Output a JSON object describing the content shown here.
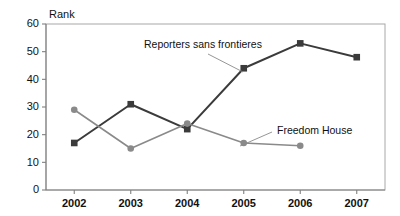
{
  "chart_data": {
    "type": "line",
    "title": "",
    "xlabel": "",
    "ylabel": "Rank",
    "categories": [
      "2002",
      "2003",
      "2004",
      "2005",
      "2006",
      "2007"
    ],
    "x": [
      2002,
      2003,
      2004,
      2005,
      2006,
      2007
    ],
    "ylim": [
      0,
      60
    ],
    "yticks": [
      0,
      10,
      20,
      30,
      40,
      50,
      60
    ],
    "grid": false,
    "legend_position": "inline-annotation",
    "series": [
      {
        "name": "Reporters sans frontieres",
        "marker": "square",
        "color": "#3b3b3b",
        "values": [
          17,
          31,
          22,
          44,
          53,
          48
        ]
      },
      {
        "name": "Freedom House",
        "marker": "circle",
        "color": "#8a8a8a",
        "values": [
          29,
          15,
          24,
          17,
          16,
          null
        ]
      }
    ],
    "annotations": [
      {
        "text": "Reporters sans frontieres",
        "text_x": 144,
        "text_y": 48,
        "leader_from_x": 208,
        "leader_from_y": 54,
        "leader_to_x": 243,
        "leader_to_y": 72
      },
      {
        "text": "Freedom House",
        "text_x": 277,
        "text_y": 134,
        "leader_from_x": 272,
        "leader_from_y": 132,
        "leader_to_x": 240,
        "leader_to_y": 146
      }
    ]
  },
  "axis": {
    "y_title": "Rank",
    "y_tick_labels": [
      "60",
      "50",
      "40",
      "30",
      "20",
      "10",
      "0"
    ],
    "x_tick_labels": [
      "2002",
      "2003",
      "2004",
      "2005",
      "2006",
      "2007"
    ]
  },
  "colors": {
    "series_rsf": "#3b3b3b",
    "series_freedom_house": "#8a8a8a",
    "axis": "#808080",
    "frame": "#a8a8a8",
    "background": "#ffffff",
    "text": "#111111"
  }
}
